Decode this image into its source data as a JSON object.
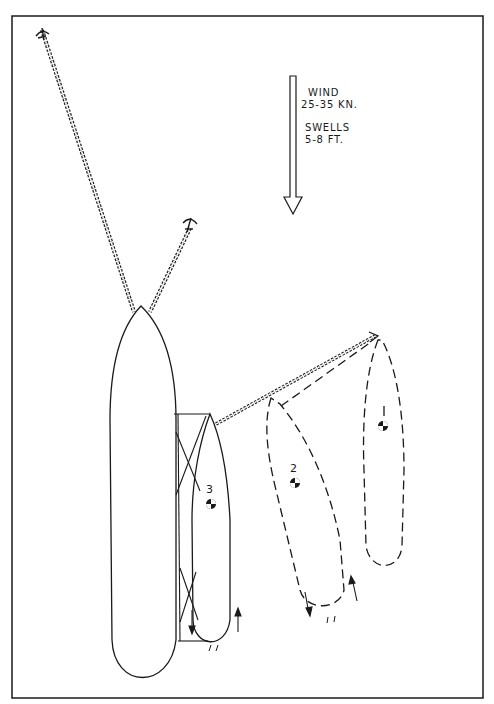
{
  "diagram": {
    "type": "ship mooring / towing arrangement sketch",
    "legend": {
      "wind_label": "WIND",
      "wind_speed": "25-35 KN.",
      "swells_label": "SWELLS",
      "swells_height": "5-8 FT.",
      "arrow_direction": "down"
    },
    "ships": [
      {
        "id": "1",
        "label": "1",
        "style": "dashed",
        "role": "position 1"
      },
      {
        "id": "2",
        "label": "2",
        "style": "dashed",
        "role": "position 2"
      },
      {
        "id": "3",
        "label": "3",
        "style": "solid",
        "role": "alongside large vessel"
      },
      {
        "id": "large",
        "label": "",
        "style": "solid",
        "role": "anchored vessel"
      }
    ],
    "anchors": [
      {
        "name": "port-anchor",
        "chain": "long"
      },
      {
        "name": "starboard-anchor",
        "chain": "short"
      },
      {
        "name": "ship1-anchor",
        "chain": "towline to ship 3"
      }
    ],
    "colors": {
      "ink": "#1a1a1a",
      "paper": "#ffffff"
    }
  }
}
